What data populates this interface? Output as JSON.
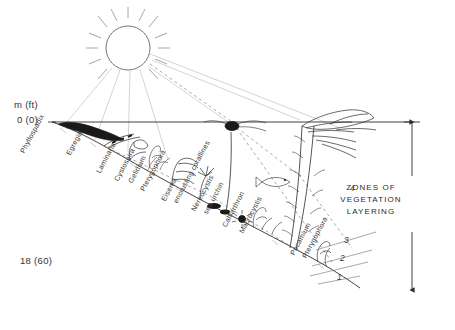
{
  "figure": {
    "type": "kelp-forest-vegetation-profile"
  },
  "depth_axis": {
    "unit_label": "m (ft)",
    "surface_label": "0 (0)",
    "bottom_label": "18 (60)",
    "surface_value_m": 0,
    "bottom_value_m": 18,
    "bottom_value_ft": 60
  },
  "taxa": [
    {
      "name": "Phyllospadix",
      "x": 22,
      "y": 148
    },
    {
      "name": "Egregia",
      "x": 68,
      "y": 150
    },
    {
      "name": "Laminaria",
      "x": 98,
      "y": 168
    },
    {
      "name": "Cystoseira",
      "x": 116,
      "y": 176
    },
    {
      "name": "Gelidium",
      "x": 130,
      "y": 178
    },
    {
      "name": "Pterygophora",
      "x": 142,
      "y": 186
    },
    {
      "name": "Eisenia",
      "x": 163,
      "y": 196
    },
    {
      "name": "encrusting corallines",
      "x": 175,
      "y": 198
    },
    {
      "name": "Nereocystis",
      "x": 193,
      "y": 206
    },
    {
      "name": "sea urchin",
      "x": 205,
      "y": 209
    },
    {
      "name": "Calliarthron",
      "x": 224,
      "y": 222
    },
    {
      "name": "Macrocystis",
      "x": 241,
      "y": 228
    },
    {
      "name": "Pocamium",
      "x": 292,
      "y": 250
    },
    {
      "name": "Pterygophora2",
      "x": 304,
      "y": 253,
      "display": "Pterygophora"
    }
  ],
  "zones": {
    "title_line_1": "ZONES OF",
    "title_line_2": "VEGETATION",
    "title_line_3": "LAYERING",
    "numbers": [
      {
        "label": "4",
        "x": 350,
        "y": 188
      },
      {
        "label": "3",
        "x": 344,
        "y": 240
      },
      {
        "label": "2",
        "x": 340,
        "y": 258
      },
      {
        "label": "1",
        "x": 337,
        "y": 277
      }
    ]
  },
  "elements": {
    "sun_label": "sun",
    "fish_label": "fish",
    "surface_line_label": "water-surface",
    "seafloor_label": "seafloor"
  },
  "colors": {
    "ink": "#2b2b2b",
    "light_ink": "#6a6a6a",
    "ray": "#9a9a9a",
    "background": "#ffffff"
  }
}
